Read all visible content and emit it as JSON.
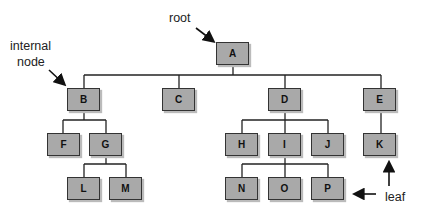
{
  "diagram": {
    "type": "tree",
    "annotations": {
      "root": "root",
      "internal": "internal\nnode",
      "internal_line1": "internal",
      "internal_line2": "node",
      "leaf": "leaf"
    },
    "nodes": [
      {
        "id": "A",
        "label": "A",
        "x": 216,
        "y": 42
      },
      {
        "id": "B",
        "label": "B",
        "x": 67,
        "y": 88
      },
      {
        "id": "C",
        "label": "C",
        "x": 162,
        "y": 88
      },
      {
        "id": "D",
        "label": "D",
        "x": 268,
        "y": 88
      },
      {
        "id": "E",
        "label": "E",
        "x": 363,
        "y": 88
      },
      {
        "id": "F",
        "label": "F",
        "x": 47,
        "y": 133
      },
      {
        "id": "G",
        "label": "G",
        "x": 89,
        "y": 133
      },
      {
        "id": "H",
        "label": "H",
        "x": 225,
        "y": 133
      },
      {
        "id": "I",
        "label": "I",
        "x": 268,
        "y": 133
      },
      {
        "id": "J",
        "label": "J",
        "x": 311,
        "y": 133
      },
      {
        "id": "K",
        "label": "K",
        "x": 363,
        "y": 133
      },
      {
        "id": "L",
        "label": "L",
        "x": 67,
        "y": 177
      },
      {
        "id": "M",
        "label": "M",
        "x": 109,
        "y": 177
      },
      {
        "id": "N",
        "label": "N",
        "x": 225,
        "y": 177
      },
      {
        "id": "O",
        "label": "O",
        "x": 268,
        "y": 177
      },
      {
        "id": "P",
        "label": "P",
        "x": 311,
        "y": 177
      }
    ],
    "edges": [
      [
        "A",
        "B"
      ],
      [
        "A",
        "C"
      ],
      [
        "A",
        "D"
      ],
      [
        "A",
        "E"
      ],
      [
        "B",
        "F"
      ],
      [
        "B",
        "G"
      ],
      [
        "G",
        "L"
      ],
      [
        "G",
        "M"
      ],
      [
        "D",
        "H"
      ],
      [
        "D",
        "I"
      ],
      [
        "D",
        "J"
      ],
      [
        "I",
        "N"
      ],
      [
        "I",
        "O"
      ],
      [
        "I",
        "P"
      ],
      [
        "E",
        "K"
      ]
    ]
  }
}
